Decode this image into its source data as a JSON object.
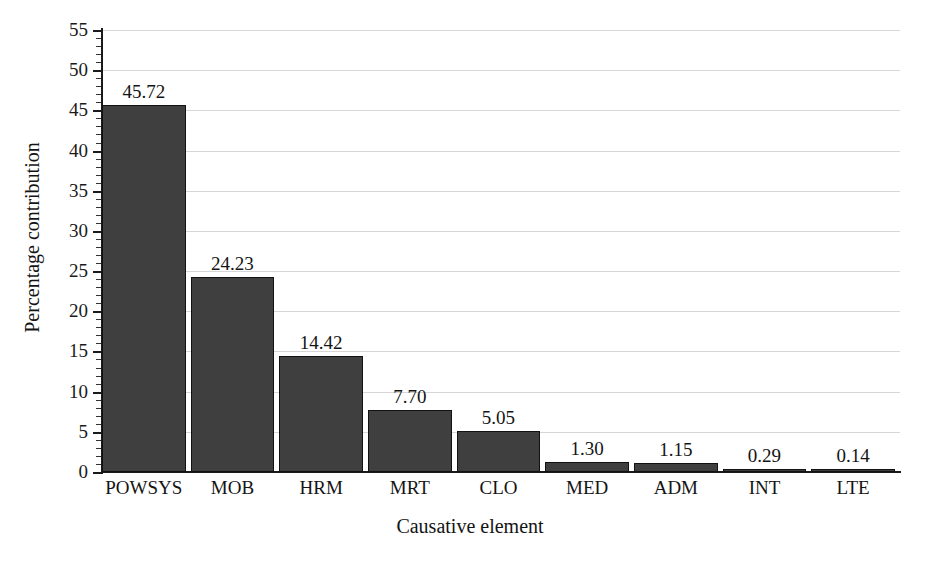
{
  "chart_data": {
    "type": "bar",
    "title": "",
    "xlabel": "Causative element",
    "ylabel": "Percentage contribution",
    "categories": [
      "POWSYS",
      "MOB",
      "HRM",
      "MRT",
      "CLO",
      "MED",
      "ADM",
      "INT",
      "LTE"
    ],
    "values": [
      45.72,
      24.23,
      14.42,
      7.7,
      5.05,
      1.3,
      1.15,
      0.29,
      0.14
    ],
    "value_labels": [
      "45.72",
      "24.23",
      "14.42",
      "7.70",
      "5.05",
      "1.30",
      "1.15",
      "0.29",
      "0.14"
    ],
    "ylim": [
      0,
      55
    ],
    "ytick_labels": [
      "0",
      "5",
      "10",
      "15",
      "20",
      "25",
      "30",
      "35",
      "40",
      "45",
      "50",
      "55"
    ],
    "ytick_values": [
      0,
      5,
      10,
      15,
      20,
      25,
      30,
      35,
      40,
      45,
      50,
      55
    ],
    "ytick_step": 5,
    "minor_tick_step": 1,
    "grid": "horizontal",
    "legend": "none",
    "bar_color": "#3f3f3f",
    "bar_edge_color": "#121212",
    "gridline_color": "#d6d6d6",
    "axis_color": "#1a1a1a",
    "background_color": "#ffffff"
  }
}
